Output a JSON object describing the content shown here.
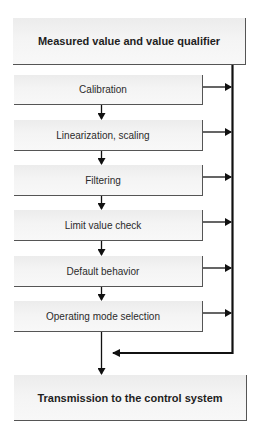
{
  "diagram": {
    "type": "flowchart",
    "top_box": {
      "label": "Measured value and value qualifier"
    },
    "steps": [
      {
        "label": "Calibration"
      },
      {
        "label": "Linearization, scaling"
      },
      {
        "label": "Filtering"
      },
      {
        "label": "Limit value check"
      },
      {
        "label": "Default behavior"
      },
      {
        "label": "Operating mode selection"
      }
    ],
    "bottom_box": {
      "label": "Transmission to the control system"
    },
    "colors": {
      "box_fill": "#f4f4f4",
      "box_border": "#555555",
      "line": "#111111",
      "text": "#2b2b2b"
    }
  }
}
